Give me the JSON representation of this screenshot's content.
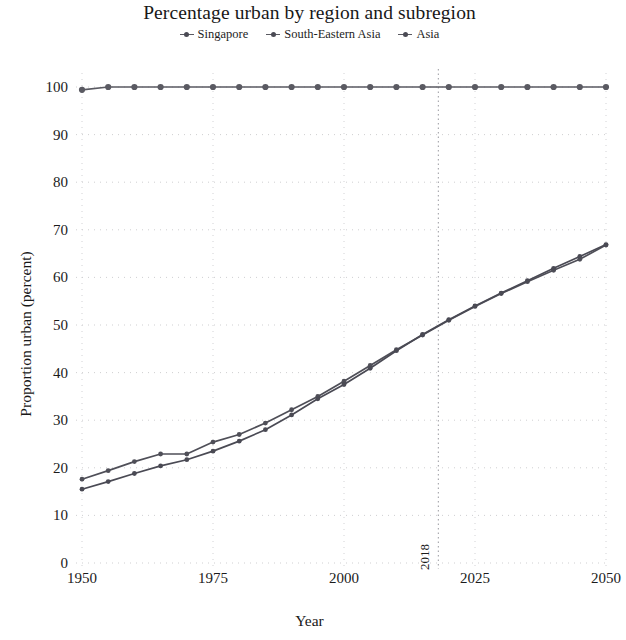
{
  "chart_data": {
    "type": "line",
    "title": "Percentage urban by region and subregion",
    "xlabel": "Year",
    "ylabel": "Proportion urban (percent)",
    "xlim": [
      1950,
      2050
    ],
    "ylim": [
      0,
      100
    ],
    "xticks": [
      "1950",
      "1975",
      "2000",
      "2025",
      "2050"
    ],
    "xtick_values": [
      1950,
      1975,
      2000,
      2025,
      2050
    ],
    "yticks": [
      "0",
      "10",
      "20",
      "30",
      "40",
      "50",
      "60",
      "70",
      "80",
      "90",
      "100"
    ],
    "ytick_values": [
      0,
      10,
      20,
      30,
      40,
      50,
      60,
      70,
      80,
      90,
      100
    ],
    "grid": true,
    "legend_position": "top-center",
    "reference_line": {
      "label": "2018",
      "x_value": 2018,
      "style": "dotted"
    },
    "x": [
      1950,
      1955,
      1960,
      1965,
      1970,
      1975,
      1980,
      1985,
      1990,
      1995,
      2000,
      2005,
      2010,
      2015,
      2020,
      2025,
      2030,
      2035,
      2040,
      2045,
      2050
    ],
    "series": [
      {
        "name": "Singapore",
        "color": "#5a5a62",
        "values": [
          99.4,
          100.0,
          100.0,
          100.0,
          100.0,
          100.0,
          100.0,
          100.0,
          100.0,
          100.0,
          100.0,
          100.0,
          100.0,
          100.0,
          100.0,
          100.0,
          100.0,
          100.0,
          100.0,
          100.0,
          100.0
        ]
      },
      {
        "name": "South-Eastern Asia",
        "color": "#4f4f58",
        "values": [
          17.6,
          19.4,
          21.3,
          22.9,
          22.9,
          25.4,
          27.0,
          29.4,
          32.2,
          35.0,
          38.2,
          41.5,
          44.8,
          47.9,
          51.0,
          53.9,
          56.6,
          59.1,
          61.5,
          63.8,
          66.8
        ]
      },
      {
        "name": "Asia",
        "color": "#4a4a54",
        "values": [
          15.5,
          17.1,
          18.8,
          20.4,
          21.7,
          23.5,
          25.6,
          28.0,
          31.1,
          34.5,
          37.5,
          40.9,
          44.6,
          48.0,
          51.1,
          54.0,
          56.7,
          59.3,
          61.9,
          64.4,
          66.9
        ]
      }
    ]
  },
  "legend": {
    "items": [
      {
        "label": "Singapore"
      },
      {
        "label": "South-Eastern Asia"
      },
      {
        "label": "Asia"
      }
    ]
  }
}
